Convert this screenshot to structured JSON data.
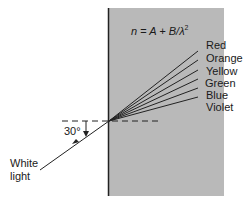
{
  "diagram": {
    "title_formula": {
      "lhs": "n",
      "rhs": "A + B/λ",
      "exponent": "2"
    },
    "incident_label_line1": "White",
    "incident_label_line2": "light",
    "angle_label": "30°",
    "colors": {
      "medium_fill": "#b9b9b9",
      "surface_line": "#222222",
      "ray_line": "#222222"
    },
    "spectrum": [
      {
        "label": "Red",
        "end_y": 51
      },
      {
        "label": "Orange",
        "end_y": 60
      },
      {
        "label": "Yellow",
        "end_y": 70
      },
      {
        "label": "Green",
        "end_y": 79
      },
      {
        "label": "Blue",
        "end_y": 88
      },
      {
        "label": "Violet",
        "end_y": 97
      }
    ]
  }
}
